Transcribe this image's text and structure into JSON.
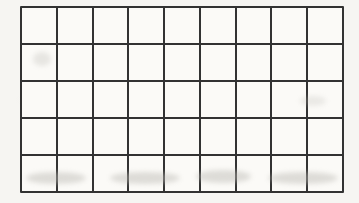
{
  "grid": {
    "rows": 5,
    "columns": 9,
    "cell_count": 45,
    "line_color": "#323232",
    "paper_color": "#f6f5f2",
    "cell_color": "#fbfaf7"
  }
}
